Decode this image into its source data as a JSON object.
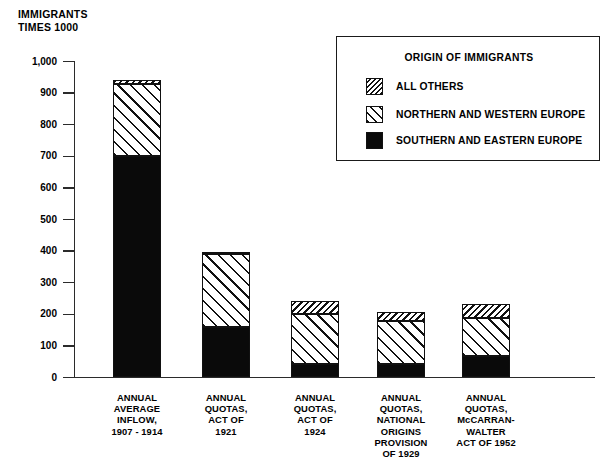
{
  "chart_data": {
    "type": "bar",
    "subtype": "stacked-bar",
    "title": "",
    "ylabel": "IMMIGRANTS\nTIMES 1000",
    "xlabel": "",
    "ylim": [
      0,
      1000
    ],
    "ytick_values": [
      0,
      100,
      200,
      300,
      400,
      500,
      600,
      700,
      800,
      900,
      1000
    ],
    "ytick_labels": [
      "0",
      "100",
      "200",
      "300",
      "400",
      "500",
      "600",
      "700",
      "800",
      "900",
      "1,000"
    ],
    "grid": false,
    "legend_position": "upper-right-inset",
    "legend_title": "ORIGIN OF IMMIGRANTS",
    "categories": [
      "ANNUAL\nAVERAGE\nINFLOW,\n1907 - 1914",
      "ANNUAL\nQUOTAS,\nACT OF\n1921",
      "ANNUAL\nQUOTAS,\nACT OF\n1924",
      "ANNUAL\nQUOTAS,\nNATIONAL\nORIGINS\nPROVISION\nOF 1929",
      "ANNUAL\nQUOTAS,\nMcCARRAN-\nWALTER\nACT OF 1952"
    ],
    "series": [
      {
        "name": "SOUTHERN AND EASTERN EUROPE",
        "pattern": "solid-black",
        "color": "#0a0a0a",
        "values": [
          700,
          160,
          42,
          44,
          68
        ]
      },
      {
        "name": "NORTHERN AND WESTERN EUROPE",
        "pattern": "sparse-diagonal-hatch",
        "color": "#ffffff",
        "values": [
          230,
          230,
          160,
          134,
          120
        ]
      },
      {
        "name": "ALL OTHERS",
        "pattern": "dense-diagonal-hatch",
        "color": "#ffffff",
        "values": [
          10,
          8,
          39,
          28,
          45
        ]
      }
    ],
    "totals": [
      940,
      398,
      241,
      206,
      233
    ]
  },
  "legend": {
    "title": "ORIGIN OF IMMIGRANTS",
    "entries": [
      {
        "label": "ALL OTHERS",
        "pattern": "dense"
      },
      {
        "label": "NORTHERN AND WESTERN EUROPE",
        "pattern": "sparse"
      },
      {
        "label": "SOUTHERN AND EASTERN EUROPE",
        "pattern": "solid"
      }
    ]
  },
  "axis": {
    "y_title": "IMMIGRANTS\nTIMES 1000",
    "ticks": [
      "1,000",
      "900",
      "800",
      "700",
      "600",
      "500",
      "400",
      "300",
      "200",
      "100",
      "0"
    ]
  },
  "colors": {
    "ink": "#111111",
    "axis": "#2b2b2b",
    "background": "#ffffff"
  }
}
